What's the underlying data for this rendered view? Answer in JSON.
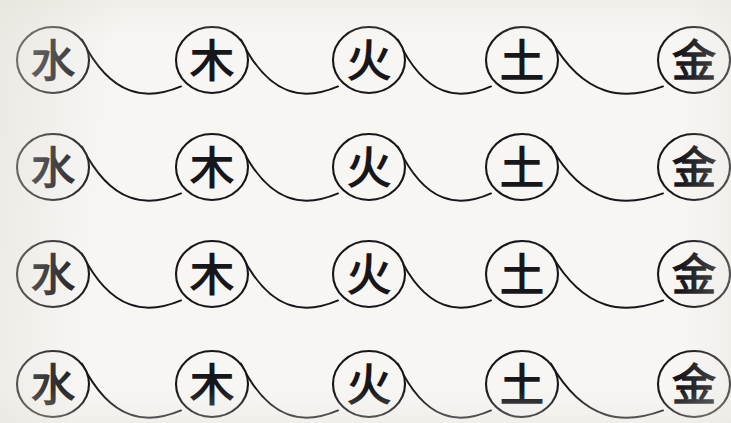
{
  "document": {
    "title": "Wu Xing Five Elements Cycle Sheet",
    "background_color": "#f7f6f3",
    "ink_color": "#17161a",
    "width": 731,
    "height": 423,
    "style": "hand-drawn brush calligraphy, scanned page"
  },
  "elements": [
    {
      "id": "water",
      "glyph": "水",
      "name": "water",
      "order": 1,
      "icon_name": "water-element-circle"
    },
    {
      "id": "wood",
      "glyph": "木",
      "name": "wood",
      "order": 2,
      "icon_name": "wood-element-circle"
    },
    {
      "id": "fire",
      "glyph": "火",
      "name": "fire",
      "order": 3,
      "icon_name": "fire-element-circle"
    },
    {
      "id": "earth",
      "glyph": "土",
      "name": "earth",
      "order": 4,
      "icon_name": "earth-element-circle"
    },
    {
      "id": "metal",
      "glyph": "金",
      "name": "metal",
      "order": 5,
      "icon_name": "metal-element-circle"
    }
  ],
  "layout": {
    "rows": 4,
    "columns": 5,
    "row_tops": [
      28,
      135,
      242,
      352
    ],
    "column_centers": [
      53,
      212,
      369,
      522,
      694
    ],
    "circle_rx": 36,
    "circle_ry": 33,
    "glyph_size": 44,
    "stroke_width": 2.1
  },
  "rows": [
    {
      "row_index": 1,
      "center_y": 60,
      "cells": [
        "water",
        "wood",
        "fire",
        "earth",
        "metal"
      ]
    },
    {
      "row_index": 2,
      "center_y": 167,
      "cells": [
        "water",
        "wood",
        "fire",
        "earth",
        "metal"
      ]
    },
    {
      "row_index": 3,
      "center_y": 274,
      "cells": [
        "water",
        "wood",
        "fire",
        "earth",
        "metal"
      ]
    },
    {
      "row_index": 4,
      "center_y": 384,
      "cells": [
        "water",
        "wood",
        "fire",
        "earth",
        "metal"
      ]
    }
  ],
  "connectors": {
    "name": "generating-cycle-curve",
    "description": "swooping link from upper-right of one circle down to lower-left of the next",
    "count_per_row": 4,
    "stroke_width": 1.9
  }
}
